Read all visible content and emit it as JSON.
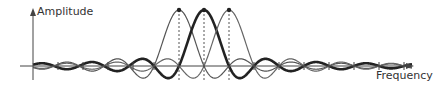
{
  "diagram": {
    "title": "",
    "y_axis_label": "Amplitude",
    "x_axis_label": "Frequency",
    "axis": {
      "origin_x": 33,
      "baseline_y": 66,
      "y_top": 8,
      "y_bottom": 80,
      "x_left": 20,
      "x_right": 414
    },
    "subcarrier_spacing_px": 25,
    "peak_height_px": 56,
    "curve_x_range": [
      33,
      412
    ],
    "subcarriers": [
      {
        "name": "subcarrier-1",
        "center_x": 179,
        "stroke": "#555555",
        "width": 1.2
      },
      {
        "name": "subcarrier-2",
        "center_x": 204,
        "stroke": "#222222",
        "width": 2.6
      },
      {
        "name": "subcarrier-3",
        "center_x": 229,
        "stroke": "#666666",
        "width": 1.2
      }
    ],
    "tick_positions": [
      58,
      83,
      108,
      133,
      154,
      254,
      279,
      304,
      329,
      354,
      379,
      404
    ],
    "colors": {
      "axis": "#444444",
      "dashed": "#555555",
      "text": "#333333"
    }
  }
}
